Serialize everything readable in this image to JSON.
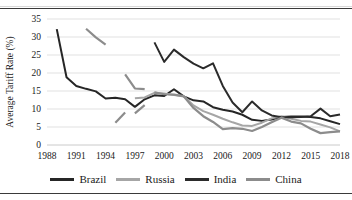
{
  "figure": {
    "title_fragment": "",
    "border_color": "#3a3a3a"
  },
  "chart_data": {
    "type": "line",
    "title": "",
    "xlabel": "",
    "ylabel": "Average Tariff Rate (%)",
    "xlim": [
      1988,
      2018
    ],
    "ylim": [
      0,
      35
    ],
    "ytick_step": 5,
    "yticks": [
      0,
      5,
      10,
      15,
      20,
      25,
      30,
      35
    ],
    "xticks": [
      1988,
      1991,
      1994,
      1997,
      2000,
      2003,
      2006,
      2009,
      2012,
      2015,
      2018
    ],
    "grid": true,
    "grid_axis": "y",
    "legend_position": "bottom",
    "series": [
      {
        "name": "Brazil",
        "color": "#262626",
        "width": 2.0,
        "points": [
          [
            1989,
            32.2
          ],
          [
            1990,
            18.8
          ],
          [
            1991,
            16.4
          ],
          [
            1992,
            15.6
          ],
          [
            1993,
            14.9
          ],
          [
            1994,
            12.9
          ],
          [
            1995,
            13.1
          ],
          [
            1996,
            12.7
          ],
          [
            1997,
            10.6
          ],
          [
            1998,
            12.7
          ],
          [
            1999,
            13.8
          ],
          [
            2000,
            13.6
          ],
          [
            2001,
            15.5
          ],
          [
            2002,
            13.5
          ],
          [
            2003,
            12.4
          ],
          [
            2004,
            12.1
          ],
          [
            2005,
            10.5
          ],
          [
            2006,
            9.8
          ],
          [
            2007,
            9.3
          ],
          [
            2008,
            8.4
          ],
          [
            2009,
            7.0
          ],
          [
            2010,
            6.7
          ],
          [
            2011,
            7.1
          ],
          [
            2012,
            7.8
          ],
          [
            2013,
            7.9
          ],
          [
            2014,
            7.9
          ],
          [
            2015,
            7.8
          ],
          [
            2016,
            7.4
          ],
          [
            2017,
            6.6
          ],
          [
            2018,
            5.8
          ]
        ]
      },
      {
        "name": "Russia",
        "color": "#a6a6a6",
        "width": 2.0,
        "points": [
          [
            1997,
            13.0
          ],
          [
            1998,
            13.2
          ],
          [
            1999,
            14.5
          ],
          [
            2000,
            14.3
          ],
          [
            2001,
            13.9
          ],
          [
            2002,
            13.6
          ],
          [
            2003,
            11.0
          ],
          [
            2004,
            9.4
          ],
          [
            2005,
            8.4
          ],
          [
            2006,
            7.3
          ],
          [
            2007,
            6.3
          ],
          [
            2008,
            5.4
          ],
          [
            2009,
            5.3
          ],
          [
            2010,
            6.2
          ],
          [
            2011,
            7.4
          ],
          [
            2012,
            8.0
          ],
          [
            2013,
            7.3
          ],
          [
            2014,
            6.7
          ],
          [
            2015,
            6.5
          ],
          [
            2016,
            5.7
          ],
          [
            2017,
            4.9
          ],
          [
            2018,
            3.8
          ]
        ]
      },
      {
        "name": "India",
        "color": "#2b2b2b",
        "width": 2.0,
        "points": [
          [
            1999,
            28.5
          ],
          [
            2000,
            23.1
          ],
          [
            2001,
            26.5
          ],
          [
            2002,
            24.4
          ],
          [
            2003,
            22.6
          ],
          [
            2004,
            21.3
          ],
          [
            2005,
            22.7
          ],
          [
            2006,
            16.4
          ],
          [
            2007,
            11.8
          ],
          [
            2008,
            9.1
          ],
          [
            2009,
            12.1
          ],
          [
            2010,
            9.6
          ],
          [
            2011,
            8.2
          ],
          [
            2012,
            7.7
          ],
          [
            2013,
            7.7
          ],
          [
            2014,
            7.8
          ],
          [
            2015,
            8.0
          ],
          [
            2016,
            10.1
          ],
          [
            2017,
            8.0
          ],
          [
            2018,
            8.5
          ]
        ]
      },
      {
        "name": "China",
        "color": "#8c8c8c",
        "width": 2.2,
        "segments": [
          [
            [
              1992,
              32.3
            ],
            [
              1993,
              29.9
            ],
            [
              1994,
              27.9
            ]
          ],
          [
            [
              1995,
              6.2
            ],
            [
              1996,
              9.0
            ]
          ],
          [
            [
              1997,
              8.8
            ],
            [
              1998,
              11.1
            ]
          ],
          [
            [
              1996,
              19.6
            ],
            [
              1997,
              15.7
            ],
            [
              1998,
              15.5
            ]
          ],
          [
            [
              1999,
              14.6
            ],
            [
              2000,
              14.1
            ],
            [
              2001,
              14.0
            ],
            [
              2002,
              13.5
            ],
            [
              2003,
              10.3
            ],
            [
              2004,
              8.0
            ],
            [
              2005,
              6.4
            ],
            [
              2006,
              4.4
            ],
            [
              2007,
              4.7
            ],
            [
              2008,
              4.5
            ],
            [
              2009,
              3.9
            ],
            [
              2010,
              5.0
            ],
            [
              2011,
              6.3
            ],
            [
              2012,
              7.6
            ],
            [
              2013,
              6.5
            ],
            [
              2014,
              6.0
            ],
            [
              2015,
              4.5
            ],
            [
              2016,
              3.3
            ],
            [
              2017,
              3.6
            ],
            [
              2018,
              3.8
            ]
          ]
        ]
      }
    ]
  },
  "legend": {
    "items": [
      {
        "label": "Brazil",
        "color": "#262626"
      },
      {
        "label": "Russia",
        "color": "#a6a6a6"
      },
      {
        "label": "India",
        "color": "#2b2b2b"
      },
      {
        "label": "China",
        "color": "#8c8c8c"
      }
    ]
  }
}
